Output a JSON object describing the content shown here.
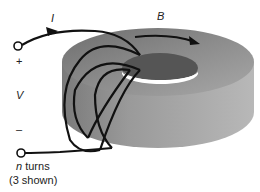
{
  "diagram": {
    "labels": {
      "current": "I",
      "field": "B",
      "plus": "+",
      "voltage": "V",
      "minus": "–",
      "turns_var": "n",
      "turns_word": " turns",
      "shown": "(3 shown)"
    },
    "colors": {
      "toroid_top": "#8a8a8a",
      "toroid_side": "#a6a6a6",
      "hole": "#5a5a5a",
      "wire": "#111111"
    }
  }
}
